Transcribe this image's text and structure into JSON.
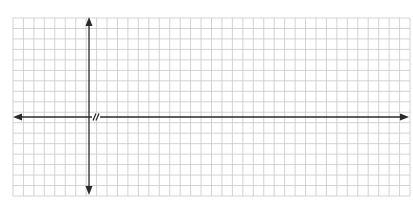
{
  "chart_data": {
    "type": "line",
    "title": "",
    "xlabel": "",
    "ylabel": "",
    "series": [],
    "grid": true,
    "grid_columns": 38,
    "grid_rows": 17,
    "axes": {
      "x_axis": {
        "arrows": "both",
        "break_mark": "//"
      },
      "y_axis": {
        "arrows": "both"
      }
    },
    "legend": null,
    "tick_labels": {
      "x": [],
      "y": []
    }
  },
  "colors": {
    "background": "#ffffff",
    "grid_line": "#c8c8c8",
    "axis_line": "#2a2a2a"
  }
}
